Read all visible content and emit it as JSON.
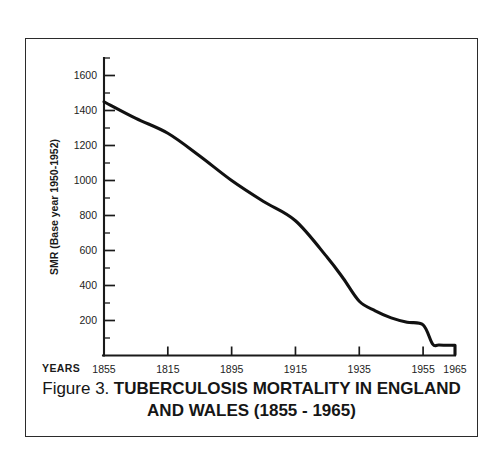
{
  "figure": {
    "caption_prefix": "Figure 3.",
    "caption_title": "TUBERCULOSIS MORTALITY IN ENGLAND AND WALES (1855 - 1965)"
  },
  "axes": {
    "y_title": "SMR (Base year 1950-1952)",
    "x_title": "YEARS"
  },
  "chart_data": {
    "type": "line",
    "title": "Figure 3. TUBERCULOSIS MORTALITY IN ENGLAND AND WALES (1855 - 1965)",
    "xlabel": "YEARS",
    "ylabel": "SMR (Base year 1950-1952)",
    "grid": false,
    "legend": "none",
    "xlim": [
      1855,
      1965
    ],
    "ylim": [
      0,
      1700
    ],
    "x_tick_labels": [
      "1855",
      "1815",
      "1895",
      "1915",
      "1935",
      "1955",
      "1965"
    ],
    "x_tick_values": [
      1855,
      1875,
      1895,
      1915,
      1935,
      1955,
      1965
    ],
    "y_ticks": [
      200,
      400,
      600,
      800,
      1000,
      1200,
      1400,
      1600
    ],
    "y_tick_labels": [
      "200",
      "400",
      "600",
      "800",
      "1000",
      "1200",
      "1400",
      "1600"
    ],
    "y_minor_tick_step": 100,
    "series": [
      {
        "name": "SMR",
        "x": [
          1855,
          1865,
          1875,
          1885,
          1895,
          1905,
          1915,
          1925,
          1930,
          1935,
          1940,
          1945,
          1950,
          1955,
          1958,
          1960,
          1965
        ],
        "values": [
          1450,
          1355,
          1270,
          1140,
          1000,
          880,
          770,
          560,
          440,
          310,
          255,
          215,
          190,
          175,
          65,
          60,
          58
        ]
      }
    ]
  }
}
